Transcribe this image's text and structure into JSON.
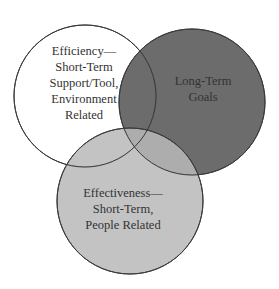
{
  "diagram": {
    "type": "venn",
    "circles": [
      {
        "id": "efficiency",
        "cx": 85,
        "cy": 96,
        "r": 71,
        "fill": "#ffffff",
        "fill_opacity": 1,
        "stroke": "#3a3a3a",
        "lines": [
          "Efficiency—",
          "Short-Term",
          "Support/Tool,",
          "Environment",
          "Related"
        ],
        "text_x": 84,
        "text_y_start": 55,
        "line_height": 16
      },
      {
        "id": "long-term",
        "cx": 192,
        "cy": 102,
        "r": 73,
        "fill": "#5a5a5a",
        "fill_opacity": 0.9,
        "stroke": "#3a3a3a",
        "lines": [
          "Long-Term",
          "Goals"
        ],
        "text_x": 202,
        "text_y_start": 85,
        "line_height": 16
      },
      {
        "id": "effectiveness",
        "cx": 130,
        "cy": 201,
        "r": 73,
        "fill": "#bdbdbd",
        "fill_opacity": 0.82,
        "stroke": "#3a3a3a",
        "lines": [
          "Effectiveness—",
          "Short-Term,",
          "People Related"
        ],
        "text_x": 129,
        "text_y_start": 197,
        "line_height": 16
      }
    ]
  },
  "labels": {
    "efficiency": {
      "line1": "Efficiency—",
      "line2": "Short-Term",
      "line3": "Support/Tool,",
      "line4": "Environment",
      "line5": "Related"
    },
    "long_term": {
      "line1": "Long-Term",
      "line2": "Goals"
    },
    "effectiveness": {
      "line1": "Effectiveness—",
      "line2": "Short-Term,",
      "line3": "People Related"
    }
  },
  "colors": {
    "background": "#ffffff",
    "efficiency_fill": "#ffffff",
    "long_term_fill": "#5f5f5f",
    "effectiveness_fill": "#bcbcbc",
    "overlap_dark": "#4e4e4e",
    "stroke": "#3a3a3a",
    "text": "#333333"
  }
}
